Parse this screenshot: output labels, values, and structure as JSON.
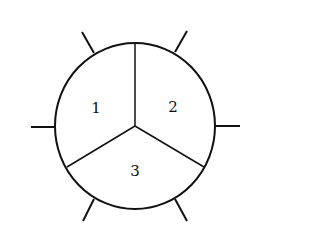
{
  "diagram": {
    "type": "partitioned-circle-with-ticks",
    "colors": {
      "line": "#111111",
      "background": "#ffffff"
    },
    "regions": [
      {
        "id": "1",
        "label": "1"
      },
      {
        "id": "2",
        "label": "2"
      },
      {
        "id": "3",
        "label": "3"
      }
    ],
    "tick_count": 6
  }
}
